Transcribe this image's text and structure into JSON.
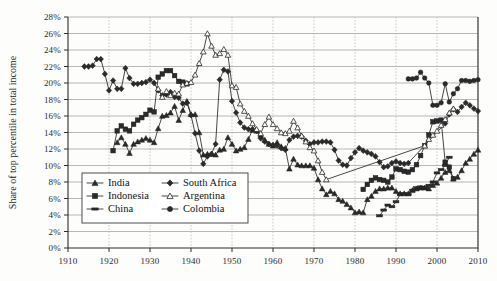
{
  "chart_data": {
    "type": "line",
    "title": "",
    "xlabel": "",
    "ylabel": "Share of top percentile in total income",
    "xlim": [
      1910,
      2010
    ],
    "ylim": [
      0,
      28
    ],
    "ytick_labels": [
      "0%",
      "2%",
      "4%",
      "6%",
      "8%",
      "10%",
      "12%",
      "14%",
      "16%",
      "18%",
      "20%",
      "22%",
      "24%",
      "26%",
      "28%"
    ],
    "ytick_values": [
      0,
      2,
      4,
      6,
      8,
      10,
      12,
      14,
      16,
      18,
      20,
      22,
      24,
      26,
      28
    ],
    "xtick_labels": [
      "1910",
      "1920",
      "1930",
      "1940",
      "1950",
      "1960",
      "1970",
      "1980",
      "1990",
      "2000",
      "2010"
    ],
    "xtick_values": [
      1910,
      1920,
      1930,
      1940,
      1950,
      1960,
      1970,
      1980,
      1990,
      2000,
      2010
    ],
    "grid": {
      "horizontal": true,
      "vertical": true
    },
    "legend_position": "lower-left-inside",
    "series": [
      {
        "name": "India",
        "marker": "triangle-filled",
        "x": [
          1922,
          1923,
          1924,
          1925,
          1926,
          1927,
          1928,
          1929,
          1930,
          1931,
          1932,
          1933,
          1934,
          1935,
          1936,
          1937,
          1938,
          1939,
          1940,
          1941,
          1942,
          1943,
          1944,
          1945,
          1946,
          1947,
          1948,
          1949,
          1950,
          1951,
          1952,
          1953,
          1954,
          1955,
          1956,
          1957,
          1958,
          1959,
          1960,
          1961,
          1962,
          1963,
          1964,
          1965,
          1966,
          1967,
          1968,
          1969,
          1970,
          1971,
          1972,
          1973,
          1974,
          1975,
          1976,
          1977,
          1978,
          1979,
          1980,
          1981,
          1982,
          1983,
          1984,
          1985,
          1986,
          1987,
          1988,
          1989,
          1990,
          1991,
          1992,
          1993,
          1994,
          1995,
          1996,
          1997,
          1998,
          1999,
          2000,
          2001,
          2002,
          2003,
          2004,
          2005,
          2006,
          2007,
          2008,
          2009,
          2010
        ],
        "y": [
          12.8,
          13.4,
          12.6,
          11.5,
          12.6,
          12.9,
          13.1,
          13.3,
          13.1,
          12.8,
          14.5,
          16.0,
          16.1,
          16.4,
          17.2,
          15.5,
          16.7,
          17.8,
          16.2,
          16.2,
          14.0,
          11.3,
          11.4,
          11.4,
          11.3,
          11.9,
          12.0,
          13.4,
          12.6,
          11.8,
          12.0,
          12.2,
          13.2,
          14.3,
          14.2,
          13.7,
          13.1,
          12.6,
          12.4,
          12.8,
          12.3,
          12.1,
          9.6,
          10.8,
          10.1,
          10.0,
          10.0,
          10.0,
          9.7,
          8.3,
          7.2,
          6.5,
          6.9,
          6.6,
          5.9,
          5.7,
          5.3,
          4.9,
          4.3,
          4.4,
          4.3,
          5.9,
          6.3,
          6.9,
          7.2,
          7.2,
          7.3,
          7.3,
          6.9,
          6.6,
          6.6,
          6.6,
          7.0,
          7.2,
          7.3,
          7.3,
          7.2,
          7.6,
          7.9,
          8.5,
          9.2,
          9.4,
          8.4,
          8.6,
          9.4,
          10.3,
          10.8,
          11.4,
          11.9
        ]
      },
      {
        "name": "Indonesia",
        "marker": "square-filled",
        "x": [
          1921,
          1922,
          1923,
          1924,
          1925,
          1926,
          1927,
          1928,
          1929,
          1930,
          1931,
          1932,
          1933,
          1934,
          1935,
          1936,
          1937,
          1938,
          1939
        ],
        "y": [
          11.8,
          14.2,
          14.8,
          14.4,
          14.2,
          15.0,
          15.5,
          15.8,
          16.2,
          16.7,
          16.5,
          20.7,
          21.1,
          21.5,
          21.5,
          20.9,
          20.2,
          20.1,
          19.9
        ]
      },
      {
        "name": "Indonesia (post-war)",
        "marker": "square-filled",
        "x": [
          1982,
          1983,
          1984,
          1985,
          1986,
          1987,
          1988,
          1989,
          1990,
          1991,
          1992,
          1993,
          1994,
          1995,
          1996,
          1997,
          1998,
          1999,
          2000,
          2001,
          2002,
          2003,
          2004
        ],
        "y": [
          7.1,
          7.7,
          8.2,
          8.5,
          8.3,
          8.2,
          8.0,
          8.6,
          9.6,
          9.5,
          9.3,
          9.2,
          9.5,
          10.1,
          11.2,
          12.4,
          13.7,
          15.3,
          15.4,
          15.5,
          10.4,
          9.8,
          8.4
        ]
      },
      {
        "name": "China",
        "marker": "dash-filled",
        "x": [
          1986,
          1987,
          1988,
          1989,
          1990,
          1991,
          1992,
          1993,
          1994,
          1995,
          1996,
          1997,
          1998,
          1999,
          2000,
          2001,
          2002,
          2003
        ],
        "y": [
          3.9,
          4.6,
          5.2,
          5.0,
          5.6,
          6.5,
          6.6,
          6.5,
          7.0,
          7.3,
          7.4,
          7.3,
          7.6,
          8.0,
          9.1,
          9.5,
          10.0,
          11.0
        ]
      },
      {
        "name": "South Africa",
        "marker": "diamond-filled",
        "x": [
          1914,
          1915,
          1916,
          1917,
          1918,
          1919,
          1920,
          1921,
          1922,
          1923,
          1924,
          1925,
          1926,
          1927,
          1928,
          1929,
          1930,
          1931,
          1932,
          1933,
          1934,
          1935,
          1936,
          1937,
          1938,
          1939,
          1940,
          1941,
          1942,
          1943,
          1944,
          1945,
          1946,
          1947,
          1948,
          1949,
          1950,
          1951,
          1952,
          1953,
          1954,
          1955,
          1956,
          1957,
          1958,
          1959,
          1960,
          1961,
          1962,
          1963,
          1964,
          1965,
          1966,
          1967,
          1968,
          1969,
          1970,
          1971,
          1972,
          1973,
          1974,
          1975,
          1976,
          1977,
          1978,
          1979,
          1980,
          1981,
          1982,
          1983,
          1984,
          1985,
          1986,
          1987,
          1988,
          1989,
          1990,
          1991,
          1992,
          1993,
          2002,
          2003,
          2004,
          2005,
          2006,
          2007,
          2008,
          2009,
          2010
        ],
        "y": [
          22.0,
          22.0,
          22.1,
          22.9,
          22.9,
          21.1,
          19.1,
          20.3,
          19.3,
          19.3,
          21.8,
          20.6,
          19.9,
          19.9,
          20.0,
          20.1,
          20.4,
          20.0,
          19.1,
          18.5,
          18.6,
          18.9,
          18.3,
          18.2,
          17.5,
          17.6,
          16.1,
          13.9,
          11.8,
          10.2,
          11.1,
          11.4,
          12.6,
          20.4,
          21.6,
          21.4,
          17.8,
          16.4,
          15.2,
          14.6,
          14.4,
          14.4,
          14.2,
          13.3,
          12.9,
          12.6,
          12.5,
          12.4,
          12.1,
          11.9,
          13.1,
          13.5,
          13.6,
          13.5,
          13.0,
          12.6,
          12.8,
          12.8,
          12.9,
          12.9,
          12.8,
          11.9,
          10.6,
          10.1,
          10.0,
          10.9,
          11.6,
          12.1,
          11.8,
          11.6,
          11.4,
          11.1,
          10.4,
          9.8,
          9.9,
          10.3,
          10.5,
          10.3,
          10.2,
          10.3,
          15.1,
          16.2,
          16.8,
          16.5,
          17.1,
          17.6,
          17.3,
          16.9,
          16.6
        ]
      },
      {
        "name": "Argentina",
        "marker": "triangle-open",
        "x": [
          1932,
          1933,
          1934,
          1935,
          1936,
          1937,
          1938,
          1939,
          1940,
          1941,
          1942,
          1943,
          1944,
          1945,
          1946,
          1947,
          1948,
          1949,
          1950,
          1951,
          1952,
          1953,
          1954,
          1955,
          1956,
          1957,
          1958,
          1959,
          1960,
          1961,
          1962,
          1963,
          1964,
          1965,
          1966,
          1967,
          1968,
          1969,
          1970,
          1971,
          1972,
          1973,
          1997,
          1998,
          1999,
          2000,
          2001,
          2002,
          2003,
          2004
        ],
        "y": [
          19.3,
          18.3,
          19.0,
          18.5,
          18.8,
          18.7,
          19.8,
          20.0,
          20.1,
          21.0,
          22.4,
          23.8,
          26.0,
          24.5,
          23.4,
          23.6,
          24.1,
          23.4,
          19.7,
          19.5,
          17.5,
          16.6,
          16.0,
          15.1,
          14.4,
          13.9,
          15.0,
          15.9,
          15.0,
          14.5,
          14.0,
          13.9,
          14.2,
          15.4,
          14.6,
          13.6,
          12.9,
          12.2,
          11.8,
          10.6,
          9.2,
          8.3,
          12.4,
          13.2,
          13.7,
          14.2,
          14.9,
          15.6,
          16.4,
          16.9
        ]
      },
      {
        "name": "Colombia",
        "marker": "circle-filled",
        "x": [
          1993,
          1994,
          1995,
          1996,
          1997,
          1998,
          1999,
          2000,
          2001,
          2002,
          2003,
          2004,
          2005,
          2006,
          2007,
          2008,
          2009,
          2010
        ],
        "y": [
          20.5,
          20.5,
          20.6,
          21.3,
          20.6,
          20.0,
          17.3,
          17.3,
          17.6,
          19.9,
          17.7,
          18.7,
          19.3,
          20.3,
          20.3,
          20.2,
          20.3,
          20.4
        ]
      }
    ]
  },
  "legend": {
    "entries": [
      {
        "label": "India",
        "marker": "triangle-filled"
      },
      {
        "label": "South Africa",
        "marker": "diamond-filled"
      },
      {
        "label": "Indonesia",
        "marker": "square-filled"
      },
      {
        "label": "Argentina",
        "marker": "triangle-open"
      },
      {
        "label": "China",
        "marker": "dash-filled"
      },
      {
        "label": "Colombia",
        "marker": "circle-filled"
      }
    ]
  },
  "colors": {
    "ink": "#262626",
    "grid": "#9a9a9a",
    "grid_vertical": "#b5b5b5",
    "background": "#fdfdfc"
  }
}
